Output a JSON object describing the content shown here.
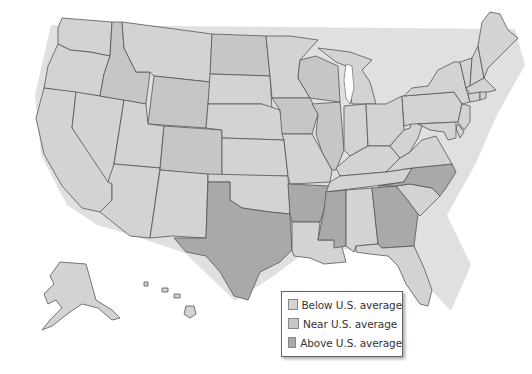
{
  "map": {
    "title": "",
    "region": "United States",
    "categories": [
      {
        "key": "below",
        "label": "Below U.S. average",
        "color": "#d3d3d3"
      },
      {
        "key": "near",
        "label": "Near U.S. average",
        "color": "#c6c6c6"
      },
      {
        "key": "above",
        "label": "Above U.S. average",
        "color": "#a9a9a9"
      }
    ],
    "states_above": [
      "Texas",
      "Arkansas",
      "Mississippi",
      "Georgia",
      "North Carolina"
    ],
    "states_near": [
      "Idaho",
      "Wyoming",
      "Colorado",
      "North Dakota",
      "Iowa",
      "Illinois",
      "Wisconsin"
    ],
    "states_below": [
      "Washington",
      "Oregon",
      "California",
      "Nevada",
      "Utah",
      "Arizona",
      "Montana",
      "New Mexico",
      "South Dakota",
      "Nebraska",
      "Kansas",
      "Oklahoma",
      "Minnesota",
      "Missouri",
      "Louisiana",
      "Michigan",
      "Indiana",
      "Ohio",
      "Kentucky",
      "Tennessee",
      "Alabama",
      "Florida",
      "South Carolina",
      "Virginia",
      "West Virginia",
      "Pennsylvania",
      "New York",
      "New Jersey",
      "Delaware",
      "Maryland",
      "Connecticut",
      "Rhode Island",
      "Massachusetts",
      "Vermont",
      "New Hampshire",
      "Maine",
      "Alaska",
      "Hawaii"
    ]
  },
  "legend": {
    "items": [
      {
        "label": "Below U.S. average",
        "color": "#d3d3d3"
      },
      {
        "label": "Near U.S. average",
        "color": "#c6c6c6"
      },
      {
        "label": "Above U.S. average",
        "color": "#a9a9a9"
      }
    ]
  }
}
